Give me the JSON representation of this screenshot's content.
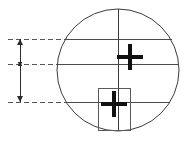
{
  "figure": {
    "canvas": {
      "width": 184,
      "height": 143,
      "background": "#ffffff"
    },
    "colors": {
      "outline": "#3c3c3c",
      "chord": "#4a4a4a",
      "centerline": "#3c3c3c",
      "crosshair": "#111111",
      "rectangle": "#5a5a5a",
      "dimension": "#2b2b2b",
      "dashed_leader": "#555555"
    },
    "circle": {
      "label": "main-circle",
      "center_x": 118,
      "center_y": 70,
      "radius": 61,
      "stroke_width": 1
    },
    "centerline": {
      "label": "vertical-centerline",
      "x": 118,
      "y_top": 9,
      "y_bottom": 131,
      "stroke_width": 1
    },
    "chords": [
      {
        "label": "chord-upper",
        "y": 39,
        "x_start": 66,
        "x_end": 172
      },
      {
        "label": "chord-middle",
        "y": 64,
        "x_start": 58,
        "x_end": 178
      },
      {
        "label": "chord-lower",
        "y": 102,
        "x_start": 68,
        "x_end": 170
      }
    ],
    "crosshairs": [
      {
        "label": "crosshair-upper",
        "center_x": 130,
        "center_y": 57,
        "arm_length": 13,
        "thickness": 4
      },
      {
        "label": "crosshair-lower",
        "center_x": 114,
        "center_y": 104,
        "arm_length": 13,
        "thickness": 4
      }
    ],
    "rectangle": {
      "label": "detail-rectangle",
      "x": 98,
      "y": 88,
      "width": 32,
      "height": 42,
      "stroke_width": 1
    },
    "dimension": {
      "label": "vertical-dimension",
      "line_x": 20,
      "y_top": 39,
      "y_middle": 64,
      "y_bottom": 102,
      "arrow_size": 3,
      "stroke_width": 1,
      "segments": [
        {
          "label": "segment-upper",
          "from_y": 39,
          "to_y": 64
        },
        {
          "label": "segment-lower",
          "from_y": 64,
          "to_y": 102
        }
      ]
    },
    "leaders": [
      {
        "label": "leader-top",
        "y": 39,
        "x_start": 8,
        "x_end": 70
      },
      {
        "label": "leader-middle",
        "y": 64,
        "x_start": 8,
        "x_end": 62
      },
      {
        "label": "leader-bottom",
        "y": 102,
        "x_start": 8,
        "x_end": 72
      }
    ],
    "dash_pattern": "5,3"
  }
}
